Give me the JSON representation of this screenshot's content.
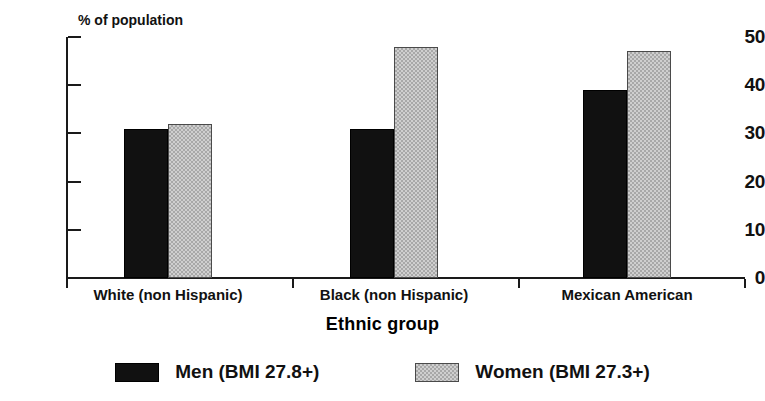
{
  "chart_data": {
    "type": "bar",
    "title": "",
    "subtitle": "",
    "categories": [
      "White (non Hispanic)",
      "Black (non Hispanic)",
      "Mexican American"
    ],
    "series": [
      {
        "name": "Men (BMI 27.8+)",
        "values": [
          31,
          31,
          39
        ],
        "color": "#111111",
        "pattern": "solid-black"
      },
      {
        "name": "Women (BMI 27.3+)",
        "values": [
          32,
          48,
          47
        ],
        "color": "#cfcfcf",
        "pattern": "checkered-gray"
      }
    ],
    "xlabel": "Ethnic group",
    "ylabel": "% of population",
    "ylim": [
      0,
      50
    ],
    "yticks": [
      0,
      10,
      20,
      30,
      40,
      50
    ],
    "ytick_labels": [
      "0",
      "10",
      "20",
      "30",
      "40",
      "50"
    ],
    "grid": false,
    "legend_position": "bottom"
  },
  "axis": {
    "y_note": "% of population",
    "x_title": "Ethnic group",
    "ticks": [
      {
        "label": "50",
        "value": 50
      },
      {
        "label": "40",
        "value": 40
      },
      {
        "label": "30",
        "value": 30
      },
      {
        "label": "20",
        "value": 20
      },
      {
        "label": "10",
        "value": 10
      },
      {
        "label": "0",
        "value": 0
      }
    ]
  },
  "groups": [
    {
      "label": "White (non Hispanic)",
      "men": 31,
      "women": 32
    },
    {
      "label": "Black (non Hispanic)",
      "men": 31,
      "women": 48
    },
    {
      "label": "Mexican American",
      "men": 39,
      "women": 47
    }
  ],
  "legend": {
    "items": [
      {
        "label": "Men (BMI 27.8+)",
        "swatch": "black-swatch"
      },
      {
        "label": "Women (BMI 27.3+)",
        "swatch": "gray-checkered-swatch"
      }
    ]
  },
  "colors": {
    "men_fill": "#111111",
    "women_fill": "#cfcfcf",
    "axis": "#1a1a1a",
    "text": "#111111",
    "background": "#ffffff"
  }
}
